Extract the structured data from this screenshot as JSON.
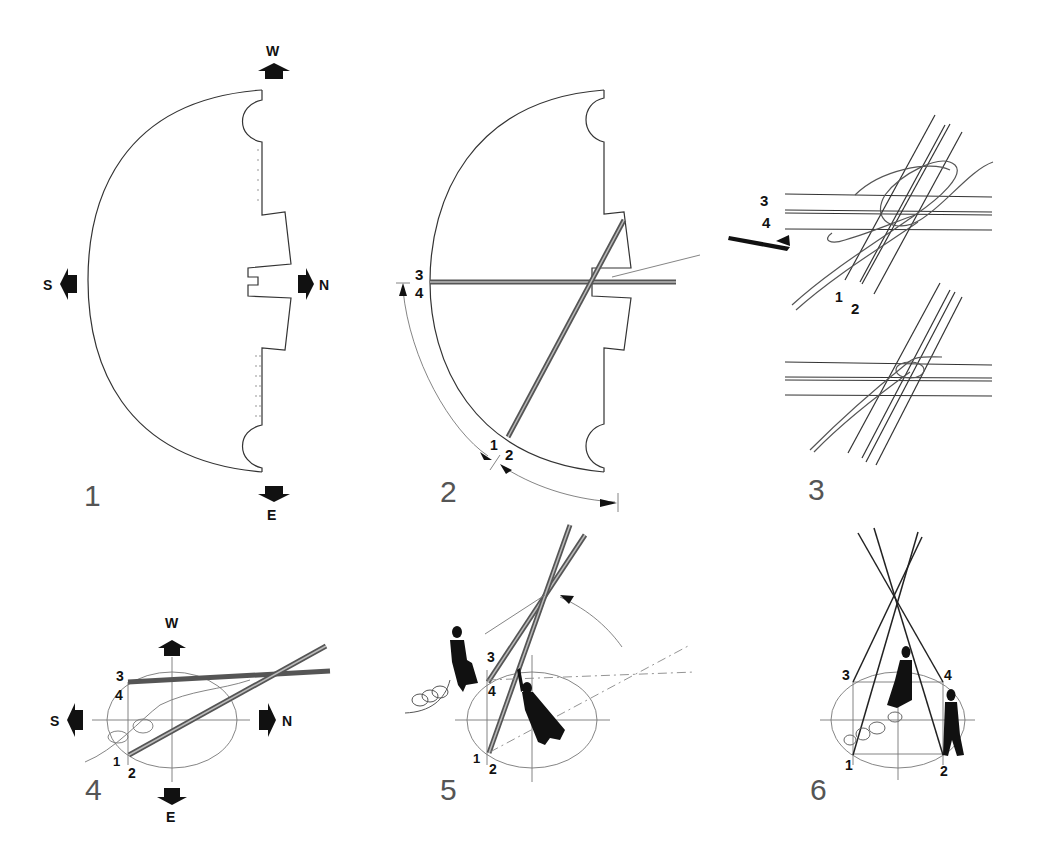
{
  "diagram": {
    "steps": [
      {
        "number": "1",
        "description": "Half-circle cover laid out with compass orientation",
        "compass": {
          "top": "W",
          "left": "S",
          "right": "N",
          "bottom": "E"
        }
      },
      {
        "number": "2",
        "description": "Two poles laid across the cover, measured along the arc",
        "pole_labels": [
          "3",
          "4",
          "1",
          "2"
        ]
      },
      {
        "number": "3",
        "description": "Detail: poles lashed together with rope (loose and tightened knot)",
        "pole_labels": [
          "3",
          "4",
          "1",
          "2"
        ]
      },
      {
        "number": "4",
        "description": "Poles positioned on the ground circle",
        "compass": {
          "top": "W",
          "left": "S",
          "right": "N",
          "bottom": "E"
        },
        "pole_labels": [
          "3",
          "4",
          "1",
          "2"
        ]
      },
      {
        "number": "5",
        "description": "Two people raising the tied poles",
        "pole_labels": [
          "3",
          "4",
          "1",
          "2"
        ]
      },
      {
        "number": "6",
        "description": "Poles spread into tripod/quadripod frame",
        "pole_labels": [
          "3",
          "4",
          "1",
          "2"
        ]
      }
    ]
  }
}
